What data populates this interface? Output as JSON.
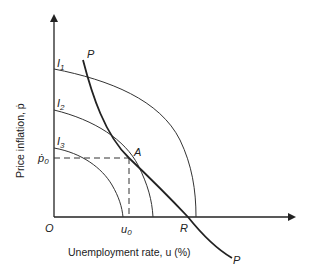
{
  "diagram": {
    "type": "economics-indifference-phillips",
    "axes": {
      "x_label": "Unemployment rate, u (%)",
      "y_label": "Price inflation, ṗ",
      "origin_label": "O"
    },
    "curves": {
      "indifference": [
        {
          "label": "I",
          "sub": "1"
        },
        {
          "label": "I",
          "sub": "2"
        },
        {
          "label": "I",
          "sub": "3"
        }
      ],
      "phillips": {
        "top_label": "P",
        "bottom_label": "P"
      }
    },
    "points": {
      "A": "A",
      "R": "R"
    },
    "ticks": {
      "u0_main": "u",
      "u0_sub": "0",
      "p0_main": "ṗ",
      "p0_sub": "0"
    }
  }
}
